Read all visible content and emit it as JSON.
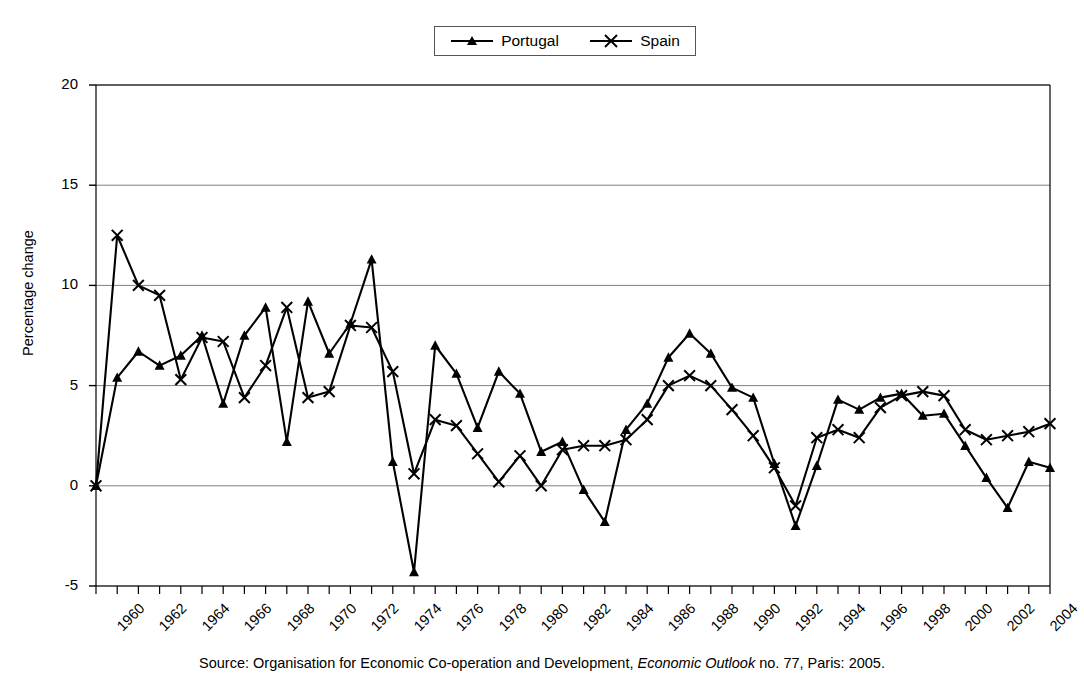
{
  "legend": {
    "position": "top-center",
    "entries": [
      {
        "label": "Portugal",
        "marker": "triangle"
      },
      {
        "label": "Spain",
        "marker": "x-cross"
      }
    ]
  },
  "axes": {
    "ylabel": "Percentage change",
    "yticks": [
      "20",
      "15",
      "10",
      "5",
      "0",
      "-5"
    ],
    "xticks": [
      "1960",
      "1962",
      "1964",
      "1966",
      "1968",
      "1970",
      "1972",
      "1974",
      "1976",
      "1978",
      "1980",
      "1982",
      "1984",
      "1986",
      "1988",
      "1990",
      "1992",
      "1994",
      "1996",
      "1998",
      "2000",
      "2002",
      "2004"
    ]
  },
  "source": {
    "prefix": "Source: Organisation for Economic Co-operation and Development, ",
    "italic": "Economic Outlook",
    "suffix": " no. 77, Paris: 2005."
  },
  "colors": {
    "line": "#000000",
    "grid": "#808080",
    "axis": "#000000",
    "background": "#ffffff"
  },
  "chart_data": {
    "type": "line",
    "title": "",
    "xlabel": "",
    "ylabel": "Percentage change",
    "xlim": [
      1960,
      2005
    ],
    "ylim": [
      -5,
      20
    ],
    "yticks": [
      -5,
      0,
      5,
      10,
      15,
      20
    ],
    "grid": "horizontal",
    "legend_position": "top-center",
    "x": [
      1960,
      1961,
      1962,
      1963,
      1964,
      1965,
      1966,
      1967,
      1968,
      1969,
      1970,
      1971,
      1972,
      1973,
      1974,
      1975,
      1976,
      1977,
      1978,
      1979,
      1980,
      1981,
      1982,
      1983,
      1984,
      1985,
      1986,
      1987,
      1988,
      1989,
      1990,
      1991,
      1992,
      1993,
      1994,
      1995,
      1996,
      1997,
      1998,
      1999,
      2000,
      2001,
      2002,
      2003,
      2004,
      2005
    ],
    "series": [
      {
        "name": "Portugal",
        "marker": "triangle",
        "values": [
          0.0,
          5.4,
          6.7,
          6.0,
          6.5,
          7.5,
          4.1,
          7.5,
          8.9,
          2.2,
          9.2,
          6.6,
          8.1,
          11.3,
          1.2,
          -4.3,
          7.0,
          5.6,
          2.9,
          5.7,
          4.6,
          1.7,
          2.2,
          -0.2,
          -1.8,
          2.8,
          4.1,
          6.4,
          7.6,
          6.6,
          4.9,
          4.4,
          1.1,
          -2.0,
          1.0,
          4.3,
          3.8,
          4.4,
          4.6,
          3.5,
          3.6,
          2.0,
          0.4,
          -1.1,
          1.2,
          0.9
        ]
      },
      {
        "name": "Spain",
        "marker": "x-cross",
        "values": [
          0.0,
          12.5,
          10.0,
          9.5,
          5.3,
          7.4,
          7.2,
          4.4,
          6.0,
          8.9,
          4.4,
          4.7,
          8.0,
          7.9,
          5.7,
          0.6,
          3.3,
          3.0,
          1.6,
          0.2,
          1.5,
          0.0,
          1.8,
          2.0,
          2.0,
          2.3,
          3.3,
          5.0,
          5.5,
          5.0,
          3.8,
          2.5,
          0.9,
          -1.0,
          2.4,
          2.8,
          2.4,
          3.9,
          4.5,
          4.7,
          4.5,
          2.8,
          2.3,
          2.5,
          2.7,
          3.1
        ]
      }
    ]
  }
}
